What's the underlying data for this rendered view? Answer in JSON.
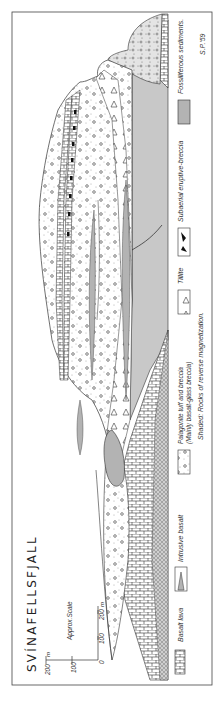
{
  "figure": {
    "title": "SVÍNAFELLSFJALL",
    "signature": "S.P.'59",
    "orientation": "rotated 90° counter-clockwise"
  },
  "scale": {
    "label": "Approx.Scale",
    "vertical_ticks": [
      "200",
      "100"
    ],
    "vertical_unit": "m",
    "horizontal_ticks": [
      "0",
      "100",
      "200"
    ],
    "horizontal_unit": "m"
  },
  "legend": {
    "items": [
      {
        "id": "basalt-lava",
        "label": "Basalt lava",
        "pattern": "brick"
      },
      {
        "id": "intrusive-basalt",
        "label": "Intrusive basalt",
        "pattern": "intrusion"
      },
      {
        "id": "palagonite",
        "label": "Palagonite tuff and breccia",
        "sublabel": "(Mainly basalt-glass breccia)",
        "pattern": "dots-circles"
      },
      {
        "id": "tillite",
        "label": "Tillite",
        "pattern": "triangles"
      },
      {
        "id": "subaerial-breccia",
        "label": "Subaerial eruptive-breccia",
        "pattern": "black-blocks"
      },
      {
        "id": "fossiliferous",
        "label": "Fossiliferous sediments.",
        "pattern": "hatched-lines"
      }
    ],
    "note": "Shaded: Rocks of reverse magnetization."
  },
  "colors": {
    "ink": "#2a2a2a",
    "paper": "#ffffff",
    "shade": "#bdbdbd"
  }
}
